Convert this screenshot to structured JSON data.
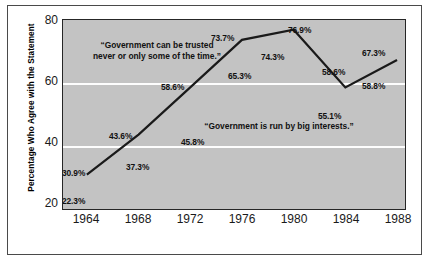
{
  "chart_data": {
    "type": "line",
    "title": "",
    "subtitle": "",
    "xlabel": "",
    "ylabel": "Percentage Who Agree with the Statement",
    "categories": [
      "1964",
      "1968",
      "1972",
      "1976",
      "1980",
      "1984",
      "1988"
    ],
    "x": [
      1964,
      1968,
      1972,
      1976,
      1980,
      1984,
      1988
    ],
    "xlim": [
      1962,
      1990
    ],
    "ylim": [
      20,
      80
    ],
    "yticks": [
      20,
      40,
      60,
      80
    ],
    "ytick_labels": [
      "20",
      "40",
      "60",
      "80"
    ],
    "gridlines": {
      "horizontal": [
        40,
        60
      ],
      "vertical": [],
      "color": "#ffffff"
    },
    "legend": {
      "position": "inline-annotations"
    },
    "plot_background": "#c3c3c3",
    "line_color": "#1a1a1a",
    "series": [
      {
        "name": "“Government can be trusted never or only some of the time.”",
        "drawn": true,
        "values": [
          30.9,
          43.6,
          58.6,
          73.7,
          76.9,
          58.6,
          67.3
        ],
        "value_labels": [
          "30.9%",
          "43.6%",
          "58.6%",
          "73.7%",
          "76.9%",
          "58.6%",
          "67.3%"
        ]
      },
      {
        "name": "“Government is run by big interests.”",
        "drawn": false,
        "values": [
          22.3,
          37.3,
          45.8,
          65.3,
          74.3,
          55.1,
          58.8
        ],
        "value_labels": [
          "22.3%",
          "37.3%",
          "45.8%",
          "65.3%",
          "74.3%",
          "55.1%",
          "58.8%"
        ]
      }
    ],
    "annotations": [
      {
        "id": "trusted-annotation",
        "line1": "“Government can be trusted",
        "line2": "never or only some of the time.”"
      },
      {
        "id": "big-interests-annotation",
        "line1": "“Government is run by big interests.”"
      }
    ]
  },
  "axis": {
    "y_title": "Percentage Who Agree with the Statement",
    "y_tick_0": "20",
    "y_tick_1": "40",
    "y_tick_2": "60",
    "y_tick_3": "80",
    "x_tick_0": "1964",
    "x_tick_1": "1968",
    "x_tick_2": "1972",
    "x_tick_3": "1976",
    "x_tick_4": "1980",
    "x_tick_5": "1984",
    "x_tick_6": "1988"
  },
  "labels": {
    "trust_1964": "30.9%",
    "trust_1968": "43.6%",
    "trust_1972": "58.6%",
    "trust_1976": "73.7%",
    "trust_1980": "76.9%",
    "trust_1984": "58.6%",
    "trust_1988": "67.3%",
    "interests_1964": "22.3%",
    "interests_1968": "37.3%",
    "interests_1972": "45.8%",
    "interests_1976": "65.3%",
    "interests_1980": "74.3%",
    "interests_1984": "55.1%",
    "interests_1988": "58.8%"
  },
  "annotations": {
    "trusted_line1": "“Government can be trusted",
    "trusted_line2": "never or only some of the time.”",
    "interests_line1": "“Government is run by big interests.”"
  }
}
